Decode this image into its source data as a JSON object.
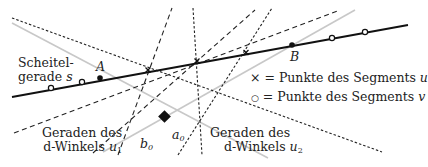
{
  "labels": {
    "scheitel_line1": "Scheitel-",
    "scheitel_line2": "gerade",
    "scheitel_symbol": "s",
    "point_a": "A",
    "point_b": "B",
    "legend_cross_symbol": "×",
    "legend_cross_text": " = Punkte des Segments ",
    "legend_cross_var": "u",
    "legend_circle_symbol": "○",
    "legend_circle_text": " = Punkte des Segments ",
    "legend_circle_var": "v",
    "u1_line1": "Geraden des",
    "u1_line2": "d-Winkels ",
    "u1_var": "u",
    "u1_sub": "1",
    "u2_line1": "Geraden des",
    "u2_line2": "d-Winkels ",
    "u2_var": "u",
    "u2_sub": "2",
    "b0_var": "b",
    "b0_sub": "0",
    "a0_var": "a",
    "a0_sub": "0"
  },
  "colors": {
    "main_line": "#111111",
    "gray_line": "#c8c8c8",
    "dashed": "#222222"
  }
}
